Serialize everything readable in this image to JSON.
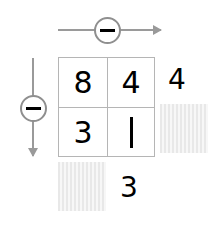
{
  "diagram": {
    "grid": {
      "rows": [
        {
          "cells": [
            {
              "value": "8"
            },
            {
              "value": "4"
            }
          ]
        },
        {
          "cells": [
            {
              "value": "3"
            },
            {
              "value": "1"
            }
          ]
        }
      ]
    },
    "operators": {
      "top": {
        "symbol": "−",
        "icon": "circled-minus-icon",
        "arrow_icon": "arrow-right-icon",
        "direction": "right"
      },
      "left": {
        "symbol": "−",
        "icon": "circled-minus-icon",
        "arrow_icon": "arrow-down-icon",
        "direction": "down"
      }
    },
    "results": {
      "row_top": "4",
      "column_left": "3"
    },
    "placeholders": {
      "row_bottom": "",
      "column_right": ""
    },
    "colors": {
      "grid_line": "#b5b5b5",
      "arrow": "#9a9a9a",
      "badge_border": "#8f8f8f",
      "digit": "#000000",
      "placeholder_fill": "#f4f4f4",
      "background": "#ffffff"
    }
  }
}
